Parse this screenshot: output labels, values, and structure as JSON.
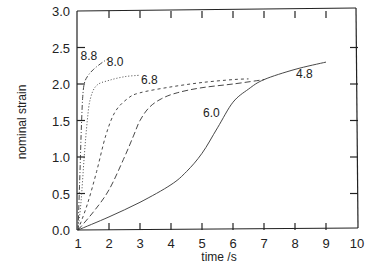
{
  "chart_data": {
    "type": "line",
    "title": "",
    "xlabel": "time /s",
    "ylabel": "nominal strain",
    "xlim": [
      1,
      10
    ],
    "ylim": [
      0,
      3.0
    ],
    "xticks": [
      "1",
      "2",
      "3",
      "4",
      "5",
      "6",
      "7",
      "8",
      "9",
      "10"
    ],
    "yticks": [
      "0.0",
      "0.5",
      "1.0",
      "1.5",
      "2.0",
      "2.5",
      "3.0"
    ],
    "grid": false,
    "legend": "none (curves labeled inline)",
    "series": [
      {
        "name": "8.8",
        "style": "dash-dot",
        "x": [
          1.0,
          1.05,
          1.1,
          1.15,
          1.2,
          1.3,
          1.5,
          1.8,
          2.0
        ],
        "y": [
          0.0,
          0.6,
          1.3,
          1.8,
          2.0,
          2.1,
          2.2,
          2.3,
          2.35
        ]
      },
      {
        "name": "8.0",
        "style": "dotted",
        "x": [
          1.0,
          1.1,
          1.2,
          1.3,
          1.4,
          1.6,
          2.0,
          2.5,
          3.0
        ],
        "y": [
          0.0,
          0.4,
          1.0,
          1.5,
          1.8,
          1.98,
          2.05,
          2.1,
          2.12
        ]
      },
      {
        "name": "6.8",
        "style": "short-dash",
        "x": [
          1.0,
          1.3,
          1.6,
          1.9,
          2.2,
          2.6,
          3.0,
          4.0,
          5.0,
          6.0,
          6.5
        ],
        "y": [
          0.0,
          0.35,
          0.8,
          1.3,
          1.62,
          1.8,
          1.88,
          1.96,
          2.02,
          2.06,
          2.07
        ]
      },
      {
        "name": "6.0",
        "style": "long-dash",
        "x": [
          1.0,
          1.5,
          2.0,
          2.5,
          2.8,
          3.0,
          3.3,
          3.7,
          4.2,
          5.0,
          6.0,
          7.0
        ],
        "y": [
          0.0,
          0.25,
          0.55,
          1.0,
          1.3,
          1.5,
          1.68,
          1.8,
          1.88,
          1.95,
          2.0,
          2.06
        ]
      },
      {
        "name": "4.8",
        "style": "solid",
        "x": [
          1.0,
          2.0,
          3.0,
          4.0,
          4.5,
          5.0,
          5.5,
          6.0,
          6.5,
          7.0,
          8.0,
          9.0
        ],
        "y": [
          0.0,
          0.18,
          0.38,
          0.62,
          0.8,
          1.05,
          1.4,
          1.75,
          1.93,
          2.06,
          2.2,
          2.3
        ]
      }
    ],
    "annotations": [
      {
        "text": "8.8",
        "x": 1.35,
        "y": 2.33
      },
      {
        "text": "8.0",
        "x": 2.2,
        "y": 2.25
      },
      {
        "text": "6.8",
        "x": 3.3,
        "y": 2.0
      },
      {
        "text": "6.0",
        "x": 5.3,
        "y": 1.55
      },
      {
        "text": "4.8",
        "x": 8.3,
        "y": 2.08
      }
    ]
  }
}
